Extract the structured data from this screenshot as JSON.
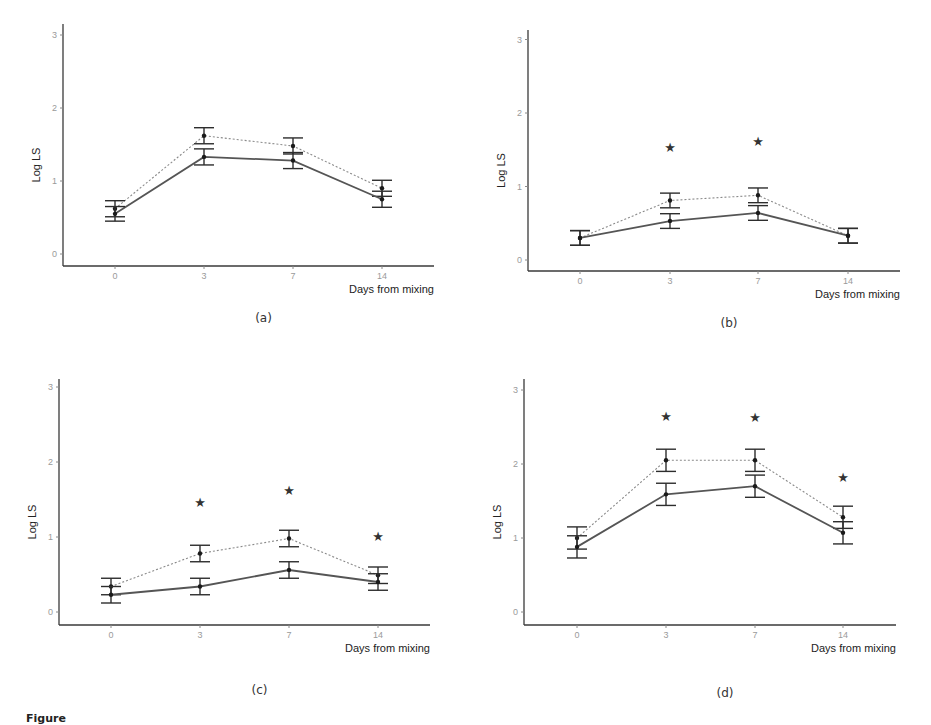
{
  "figure": {
    "caption_partial": "Figure",
    "x_axis_title": "Days from mixing",
    "y_axis_title": "Log LS"
  },
  "chart_data": [
    {
      "type": "line",
      "panel": "(a)",
      "title": "",
      "xlabel": "Days from mixing",
      "ylabel": "Log LS",
      "categories": [
        "0",
        "3",
        "7",
        "14"
      ],
      "yticks": [
        "0",
        "1",
        "2",
        "3"
      ],
      "ylim": [
        0,
        3
      ],
      "grid": false,
      "series": [
        {
          "name": "dotted",
          "style": "dotted",
          "values": [
            0.62,
            1.62,
            1.48,
            0.9
          ],
          "err": [
            0.11,
            0.11,
            0.11,
            0.11
          ]
        },
        {
          "name": "solid",
          "style": "solid",
          "values": [
            0.55,
            1.33,
            1.28,
            0.75
          ],
          "err": [
            0.1,
            0.11,
            0.11,
            0.11
          ]
        }
      ],
      "significance_stars": []
    },
    {
      "type": "line",
      "panel": "(b)",
      "title": "",
      "xlabel": "Days from mixing",
      "ylabel": "Log LS",
      "categories": [
        "0",
        "3",
        "7",
        "14"
      ],
      "yticks": [
        "0",
        "1",
        "2",
        "3"
      ],
      "ylim": [
        0,
        3
      ],
      "grid": false,
      "series": [
        {
          "name": "dotted",
          "style": "dotted",
          "values": [
            0.3,
            0.81,
            0.88,
            0.33
          ],
          "err": [
            0.1,
            0.1,
            0.1,
            0.1
          ]
        },
        {
          "name": "solid",
          "style": "solid",
          "values": [
            0.3,
            0.53,
            0.64,
            0.33
          ],
          "err": [
            0.1,
            0.1,
            0.1,
            0.1
          ]
        }
      ],
      "significance_stars": [
        {
          "x": "3",
          "y": 1.54,
          "label": "*"
        },
        {
          "x": "7",
          "y": 1.62,
          "label": "*"
        }
      ]
    },
    {
      "type": "line",
      "panel": "(c)",
      "title": "",
      "xlabel": "Days from mixing",
      "ylabel": "Log LS",
      "categories": [
        "0",
        "3",
        "7",
        "14"
      ],
      "yticks": [
        "0",
        "1",
        "2",
        "3"
      ],
      "ylim": [
        0,
        3
      ],
      "grid": false,
      "series": [
        {
          "name": "dotted",
          "style": "dotted",
          "values": [
            0.34,
            0.78,
            0.98,
            0.49
          ],
          "err": [
            0.11,
            0.11,
            0.11,
            0.11
          ]
        },
        {
          "name": "solid",
          "style": "solid",
          "values": [
            0.23,
            0.34,
            0.56,
            0.4
          ],
          "err": [
            0.11,
            0.11,
            0.11,
            0.11
          ]
        }
      ],
      "significance_stars": [
        {
          "x": "3",
          "y": 1.47,
          "label": "*"
        },
        {
          "x": "7",
          "y": 1.63,
          "label": "*"
        },
        {
          "x": "14",
          "y": 1.02,
          "label": "*"
        }
      ]
    },
    {
      "type": "line",
      "panel": "(d)",
      "title": "",
      "xlabel": "Days from mixing",
      "ylabel": "Log LS",
      "categories": [
        "0",
        "3",
        "7",
        "14"
      ],
      "yticks": [
        "0",
        "1",
        "2",
        "3"
      ],
      "ylim": [
        0,
        3
      ],
      "grid": false,
      "series": [
        {
          "name": "dotted",
          "style": "dotted",
          "values": [
            1.0,
            2.05,
            2.05,
            1.28
          ],
          "err": [
            0.15,
            0.15,
            0.15,
            0.15
          ]
        },
        {
          "name": "solid",
          "style": "solid",
          "values": [
            0.88,
            1.59,
            1.7,
            1.07
          ],
          "err": [
            0.15,
            0.15,
            0.15,
            0.15
          ]
        }
      ],
      "significance_stars": [
        {
          "x": "3",
          "y": 2.65,
          "label": "*"
        },
        {
          "x": "7",
          "y": 2.63,
          "label": "*"
        },
        {
          "x": "14",
          "y": 1.82,
          "label": "*"
        }
      ]
    }
  ],
  "layout": {
    "panels": [
      {
        "x_axis_left": 63,
        "x_axis_right": 434,
        "y_axis_top": 24,
        "x_axis_y": 266,
        "y0_px": 254,
        "y_per_unit": 73,
        "x_px": [
          115,
          204,
          293,
          382
        ],
        "label_y": 322
      },
      {
        "x_axis_left": 528,
        "x_axis_right": 900,
        "y_axis_top": 30,
        "x_axis_y": 271,
        "y0_px": 260,
        "y_per_unit": 73.5,
        "x_px": [
          580,
          670,
          758,
          848
        ],
        "label_y": 327
      },
      {
        "x_axis_left": 59,
        "x_axis_right": 430,
        "y_axis_top": 379,
        "x_axis_y": 625,
        "y0_px": 612,
        "y_per_unit": 75,
        "x_px": [
          111,
          200,
          289,
          378
        ],
        "label_y": 694
      },
      {
        "x_axis_left": 524,
        "x_axis_right": 896,
        "y_axis_top": 379,
        "x_axis_y": 625,
        "y0_px": 612,
        "y_per_unit": 74,
        "x_px": [
          577,
          666,
          755,
          843
        ],
        "label_y": 697
      }
    ]
  },
  "colors": {
    "axis": "#3a3a3a",
    "tick_label": "#9a9a9a",
    "solid_series": "#555555",
    "dotted_series": "#8a8a8a",
    "points": "#1a1a1a"
  }
}
